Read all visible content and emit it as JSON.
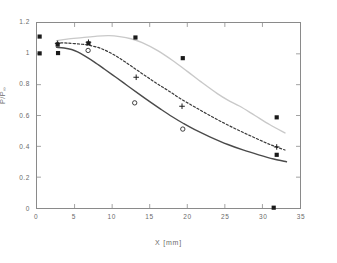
{
  "chart_data": {
    "type": "line",
    "title": "",
    "xlabel": "X  [mm]",
    "ylabel": "P/P",
    "ylabel_sub": "∞",
    "xlim": [
      0,
      35
    ],
    "ylim": [
      0,
      1.2
    ],
    "xticks": [
      0,
      5,
      10,
      15,
      20,
      25,
      30,
      35
    ],
    "xticklabels": [
      "0",
      "5",
      "10",
      "15",
      "20",
      "25",
      "30",
      "35"
    ],
    "yticks": [
      0,
      0.2,
      0.4,
      0.6,
      0.8,
      1.0,
      1.2
    ],
    "yticklabels": [
      "0",
      "0.2",
      "0.4",
      "0.6",
      "0.8",
      "1",
      "1.2"
    ],
    "grid": false,
    "legend": "none",
    "series": [
      {
        "name": "upper-curve",
        "style": "solid",
        "color": "#c9c9c9",
        "width": 1.4,
        "x": [
          2.6,
          4.0,
          6.0,
          8.0,
          9.6,
          11.0,
          12.5,
          14.0,
          16.0,
          18.0,
          20.0,
          22.0,
          24.0,
          25.4,
          27.0,
          29.0,
          31.0,
          33.0
        ],
        "y": [
          1.085,
          1.095,
          1.105,
          1.115,
          1.118,
          1.112,
          1.098,
          1.072,
          1.022,
          0.958,
          0.886,
          0.812,
          0.742,
          0.7,
          0.66,
          0.6,
          0.54,
          0.487
        ]
      },
      {
        "name": "middle-curve",
        "style": "dashed",
        "color": "#3a3a3a",
        "width": 1.2,
        "x": [
          2.6,
          4.0,
          6.0,
          7.0,
          8.5,
          10.0,
          11.5,
          13.0,
          14.5,
          16.0,
          17.5,
          19.2,
          21.0,
          23.0,
          25.0,
          27.0,
          29.0,
          31.0,
          33.0
        ],
        "y": [
          1.072,
          1.07,
          1.062,
          1.055,
          1.035,
          1.0,
          0.955,
          0.905,
          0.855,
          0.806,
          0.76,
          0.706,
          0.655,
          0.6,
          0.548,
          0.5,
          0.455,
          0.412,
          0.376
        ]
      },
      {
        "name": "lower-curve",
        "style": "solid",
        "color": "#4a4a4a",
        "width": 1.4,
        "x": [
          2.6,
          3.6,
          4.6,
          5.4,
          6.4,
          7.6,
          9.0,
          10.5,
          12.0,
          13.5,
          15.0,
          16.5,
          18.0,
          19.5,
          21.0,
          23.0,
          25.4,
          27.5,
          29.5,
          31.5,
          33.2
        ],
        "y": [
          1.042,
          1.038,
          1.028,
          1.012,
          0.985,
          0.948,
          0.9,
          0.848,
          0.795,
          0.742,
          0.69,
          0.64,
          0.592,
          0.548,
          0.508,
          0.462,
          0.412,
          0.375,
          0.345,
          0.318,
          0.3
        ]
      }
    ],
    "points": [
      {
        "marker": "square",
        "x": 0.35,
        "y": 1.112
      },
      {
        "marker": "square",
        "x": 0.35,
        "y": 1.003
      },
      {
        "marker": "square",
        "x": 2.75,
        "y": 1.06
      },
      {
        "marker": "plus",
        "x": 2.75,
        "y": 1.068
      },
      {
        "marker": "square",
        "x": 2.8,
        "y": 1.005
      },
      {
        "marker": "circle",
        "x": 6.8,
        "y": 1.022
      },
      {
        "marker": "plus",
        "x": 6.85,
        "y": 1.075
      },
      {
        "marker": "square",
        "x": 6.85,
        "y": 1.068
      },
      {
        "marker": "square",
        "x": 13.1,
        "y": 1.106
      },
      {
        "marker": "plus",
        "x": 13.2,
        "y": 0.848
      },
      {
        "marker": "circle",
        "x": 13.0,
        "y": 0.682
      },
      {
        "marker": "square",
        "x": 19.4,
        "y": 0.972
      },
      {
        "marker": "plus",
        "x": 19.3,
        "y": 0.66
      },
      {
        "marker": "circle",
        "x": 19.4,
        "y": 0.512
      },
      {
        "marker": "square",
        "x": 31.9,
        "y": 0.588
      },
      {
        "marker": "plus",
        "x": 31.9,
        "y": 0.396
      },
      {
        "marker": "square",
        "x": 31.9,
        "y": 0.345
      },
      {
        "marker": "square",
        "x": 31.5,
        "y": 0.002
      }
    ]
  }
}
